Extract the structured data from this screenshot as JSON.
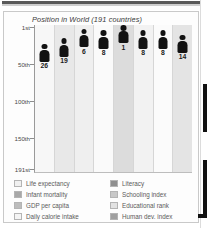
{
  "chart_data": {
    "type": "bar",
    "title": "Position in World (191 countries)",
    "xlabel": "",
    "ylabel": "",
    "ylim": [
      1,
      191
    ],
    "grid": false,
    "legend_position": "bottom",
    "ytick_labels": [
      "1st",
      "50th",
      "100th",
      "150th",
      "191st"
    ],
    "ytick_values": [
      1,
      50,
      100,
      150,
      191
    ],
    "categories": [
      "Life expectancy",
      "Infant mortality",
      "GDP per capita",
      "Daily calorie intake",
      "Literacy",
      "Schooling index",
      "Educational rank",
      "Human dev. index"
    ],
    "values": [
      26,
      19,
      6,
      8,
      1,
      8,
      8,
      14
    ],
    "value_labels": [
      "26",
      "19",
      "6",
      "8",
      "1",
      "8",
      "8",
      "14"
    ],
    "marker": "human-figure-pictogram",
    "column_shades": [
      "#f7f7f7",
      "#e8e8e8",
      "#efefef",
      "#fafafa",
      "#dcdcdc",
      "#f2f2f2",
      "#fbfbfb",
      "#e4e4e4"
    ]
  },
  "legend": {
    "left_column": [
      {
        "label": "Life expectancy",
        "color": "#f0f0f0"
      },
      {
        "label": "Infant mortality",
        "color": "#a8a8a8"
      },
      {
        "label": "GDP per capita",
        "color": "#bcbcbc"
      },
      {
        "label": "Daily calorie intake",
        "color": "#f4f4f4"
      }
    ],
    "right_column": [
      {
        "label": "Literacy",
        "color": "#8f8f8f"
      },
      {
        "label": "Schooling index",
        "color": "#c8c8c8"
      },
      {
        "label": "Educational rank",
        "color": "#e2e2e2"
      },
      {
        "label": "Human dev. index",
        "color": "#a0a0a0"
      }
    ]
  },
  "colors": {
    "figure": "#121212",
    "panel_bg": "#fdfdfd",
    "panel_border": "#c9c9c9",
    "axis": "#9a9a9a",
    "text": "#4a4a4a"
  }
}
